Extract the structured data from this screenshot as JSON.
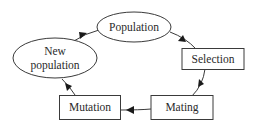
{
  "diagram": {
    "type": "cycle-flowchart",
    "nodes": [
      {
        "id": "population",
        "label": "Population",
        "shape": "ellipse"
      },
      {
        "id": "selection",
        "label": "Selection",
        "shape": "rectangle"
      },
      {
        "id": "mating",
        "label": "Mating",
        "shape": "rectangle"
      },
      {
        "id": "mutation",
        "label": "Mutation",
        "shape": "rectangle"
      },
      {
        "id": "new_population",
        "label_line1": "New",
        "label_line2": "population",
        "shape": "ellipse"
      }
    ],
    "edges": [
      {
        "from": "population",
        "to": "selection"
      },
      {
        "from": "selection",
        "to": "mating"
      },
      {
        "from": "mating",
        "to": "mutation"
      },
      {
        "from": "mutation",
        "to": "new_population"
      },
      {
        "from": "new_population",
        "to": "population"
      }
    ]
  },
  "colors": {
    "stroke": "#3a3a3a",
    "arrow": "#1a1a1a",
    "text": "#2a2a2a",
    "background": "#ffffff"
  }
}
